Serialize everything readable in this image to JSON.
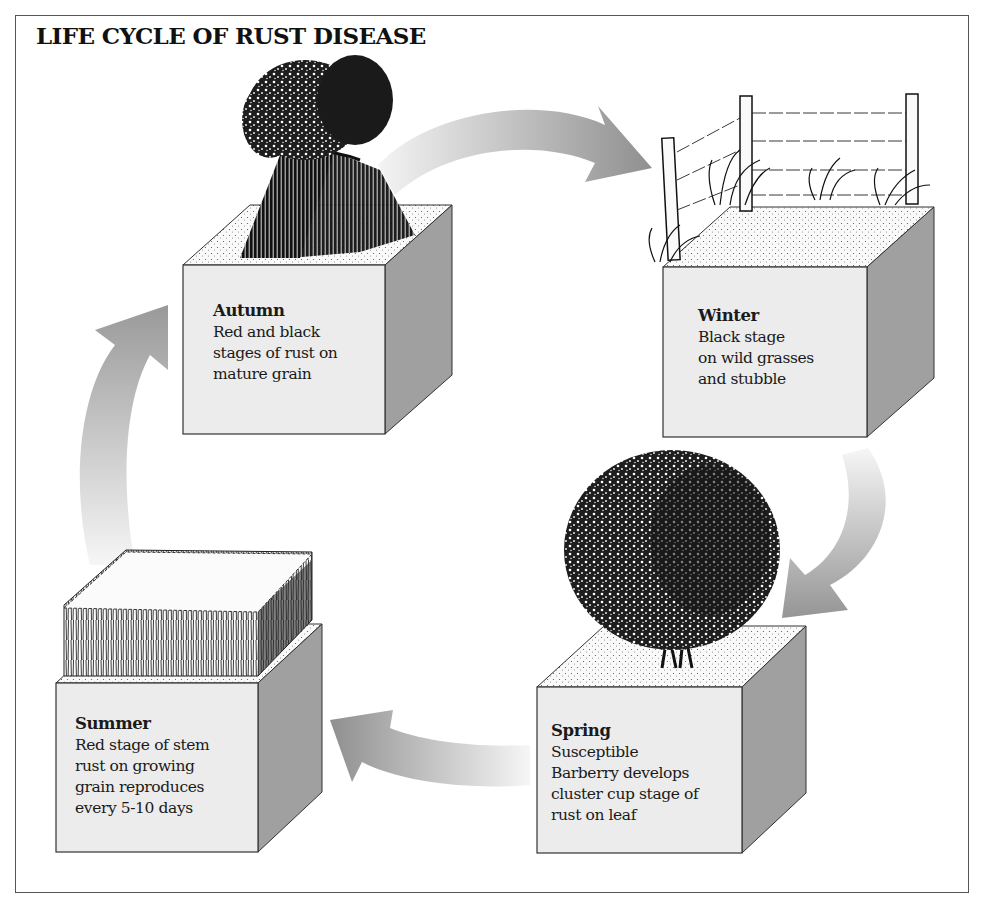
{
  "title": "LIFE CYCLE OF RUST DISEASE",
  "colors": {
    "cube_front": "#ececec",
    "cube_side": "#a0a0a0",
    "arrow_dark": "#8f8f8f",
    "arrow_light": "#f2f2f2",
    "ink": "#111111"
  },
  "stages": [
    {
      "id": "autumn",
      "season": "Autumn",
      "lines": [
        "Red and black",
        "stages of rust on",
        "mature grain"
      ],
      "illustration": "wheat-sheaf"
    },
    {
      "id": "winter",
      "season": "Winter",
      "lines": [
        "Black stage",
        "on wild grasses",
        "and stubble"
      ],
      "illustration": "fence-with-wild-grasses"
    },
    {
      "id": "spring",
      "season": "Spring",
      "lines": [
        "Susceptible",
        "Barberry develops",
        "cluster cup stage of",
        "rust on leaf"
      ],
      "illustration": "barberry-bush"
    },
    {
      "id": "summer",
      "season": "Summer",
      "lines": [
        "Red stage of stem",
        "rust on growing",
        "grain reproduces",
        "every 5-10 days"
      ],
      "illustration": "growing-grain-field"
    }
  ],
  "cycle_arrows": [
    {
      "from": "Autumn",
      "to": "Winter"
    },
    {
      "from": "Winter",
      "to": "Spring"
    },
    {
      "from": "Spring",
      "to": "Summer"
    },
    {
      "from": "Summer",
      "to": "Autumn"
    }
  ]
}
